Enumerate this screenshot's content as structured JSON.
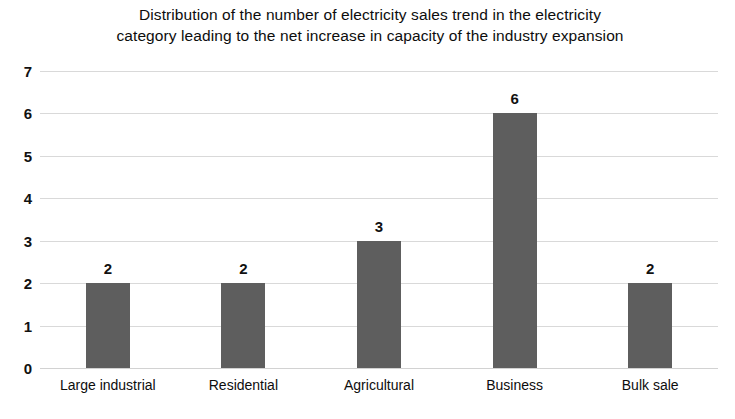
{
  "chart_data": {
    "type": "bar",
    "title": "Distribution of the number of electricity sales trend in the electricity category leading to the net increase in capacity of the industry expansion",
    "title_lines": [
      "Distribution of the number of electricity sales trend in the electricity",
      "category leading to the net increase in capacity of the industry expansion"
    ],
    "categories": [
      "Large industrial",
      "Residential",
      "Agricultural",
      "Business",
      "Bulk sale"
    ],
    "values": [
      2,
      2,
      3,
      6,
      2
    ],
    "data_labels": [
      "2",
      "2",
      "3",
      "6",
      "2"
    ],
    "xlabel": "",
    "ylabel": "",
    "ylim": [
      0,
      7
    ],
    "y_ticks": [
      7,
      6,
      5,
      4,
      3,
      2,
      1,
      0
    ],
    "y_tick_labels": [
      "7",
      "6",
      "5",
      "4",
      "3",
      "2",
      "1",
      "0"
    ],
    "grid": true,
    "grid_axis": "y",
    "legend": false,
    "legend_position": "none",
    "bar_color": "#5e5e5e",
    "grid_color": "#d9d9d9",
    "background_color": "#ffffff",
    "text_color": "#111111"
  }
}
